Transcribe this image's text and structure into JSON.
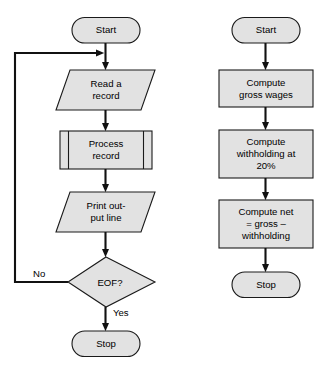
{
  "diagram": {
    "background_color": "#ffffff",
    "shape_fill_color": "#e2e2e2",
    "shape_stroke_color": "#1a1a1a",
    "connector_color": "#111111",
    "columns": [
      {
        "name": "record-processing-loop",
        "nodes": [
          {
            "id": "start-1",
            "type": "terminal",
            "label": "Start"
          },
          {
            "id": "read-record",
            "type": "input-output",
            "label_line_1": "Read a",
            "label_line_2": "record"
          },
          {
            "id": "process-record",
            "type": "predefined-process",
            "label_line_1": "Process",
            "label_line_2": "record"
          },
          {
            "id": "print-output",
            "type": "input-output",
            "label_line_1": "Print out-",
            "label_line_2": "put line"
          },
          {
            "id": "eof-decision",
            "type": "decision",
            "label": "EOF?"
          },
          {
            "id": "stop-1",
            "type": "terminal",
            "label": "Stop"
          }
        ],
        "edge_labels": {
          "no": "No",
          "yes": "Yes"
        }
      },
      {
        "name": "payroll-computation",
        "nodes": [
          {
            "id": "start-2",
            "type": "terminal",
            "label": "Start"
          },
          {
            "id": "compute-gross",
            "type": "process",
            "label_line_1": "Compute",
            "label_line_2": "gross wages"
          },
          {
            "id": "compute-withhold",
            "type": "process",
            "label_line_1": "Compute",
            "label_line_2": "withholding at",
            "label_line_3": "20%"
          },
          {
            "id": "compute-net",
            "type": "process",
            "label_line_1": "Compute net",
            "label_line_2": "= gross –",
            "label_line_3": "withholding"
          },
          {
            "id": "stop-2",
            "type": "terminal",
            "label": "Stop"
          }
        ]
      }
    ]
  }
}
